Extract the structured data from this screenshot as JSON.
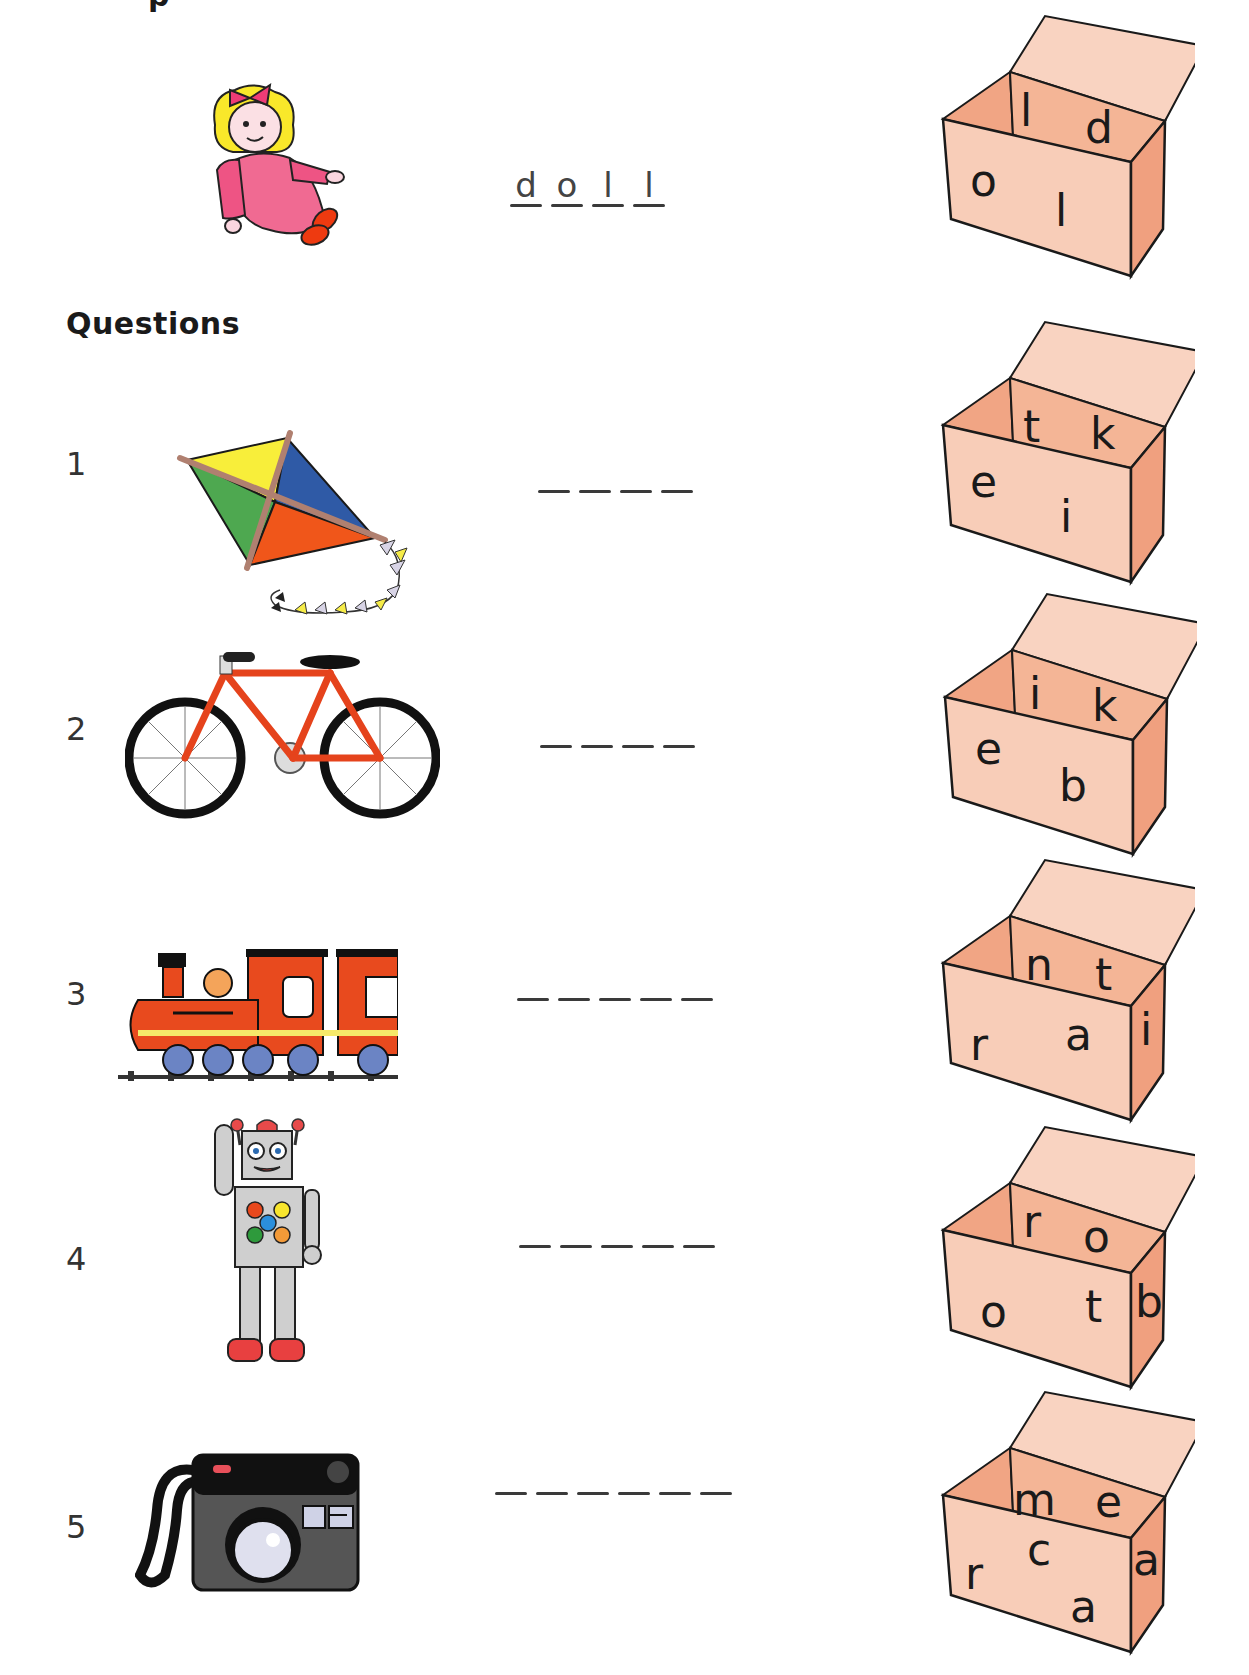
{
  "worksheet": {
    "heading_fragment": "p",
    "section_title": "Questions",
    "colors": {
      "box_face": "#f8cdb8",
      "box_interior": "#f1a584",
      "box_side": "#f0a07f",
      "box_lid": "#f9d3c1",
      "outline": "#1a1a1a"
    },
    "example": {
      "picture": "doll",
      "answer_letters": [
        "d",
        "o",
        "l",
        "l"
      ],
      "box_letters": {
        "back_left": "l",
        "back_right": "d",
        "front_left": "o",
        "front_right": "l",
        "side": ""
      }
    },
    "questions": [
      {
        "number": "1",
        "picture": "kite",
        "blanks": 4,
        "box_letters": {
          "back_left": "t",
          "back_right": "k",
          "front_left": "e",
          "front_right": "i",
          "side": ""
        }
      },
      {
        "number": "2",
        "picture": "bike",
        "blanks": 4,
        "box_letters": {
          "back_left": "i",
          "back_right": "k",
          "front_left": "e",
          "front_right": "b",
          "side": ""
        }
      },
      {
        "number": "3",
        "picture": "train",
        "blanks": 5,
        "box_letters": {
          "back_left": "n",
          "back_right": "t",
          "front_left": "r",
          "front_right": "a",
          "side": "i"
        }
      },
      {
        "number": "4",
        "picture": "robot",
        "blanks": 5,
        "box_letters": {
          "back_left": "r",
          "back_right": "o",
          "front_left": "o",
          "front_right": "t",
          "side": "b"
        }
      },
      {
        "number": "5",
        "picture": "camera",
        "blanks": 6,
        "box_letters": {
          "back_left": "m",
          "back_right": "e",
          "front_left": "r",
          "front_mid": "c",
          "front_right": "a",
          "side": "a"
        }
      }
    ]
  }
}
